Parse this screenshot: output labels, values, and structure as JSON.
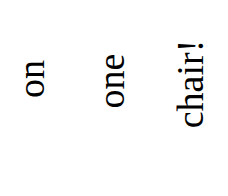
{
  "text": {
    "lines": [
      "on",
      "one",
      "chair!"
    ],
    "orientation": "rotated -90deg (reads bottom-to-top)",
    "color": "#000000",
    "background": "#ffffff"
  }
}
